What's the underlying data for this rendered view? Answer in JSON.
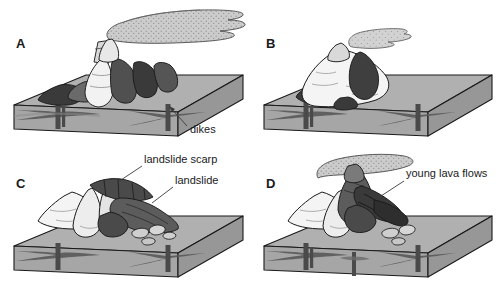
{
  "figure": {
    "background_color": "#ffffff",
    "panel_count": 4
  },
  "palette": {
    "block_top": "#b0b0b0",
    "block_front": "#a3a3a3",
    "block_side": "#9a9a9a",
    "outline": "#1a1a1a",
    "cone_light": "#f2f2f2",
    "cone_midlight": "#d6d6d6",
    "flow_mid": "#8a8a8a",
    "flow_dark": "#4a4a4a",
    "flow_darkest": "#2e2e2e",
    "plume_fill": "#c9c9c9",
    "plume_stipple": "#8f8f8f",
    "dike_dark": "#4f4f4f",
    "sill_gray": "#8c8c8c",
    "label_text": "#1a1a1a",
    "leader_line": "#3a3a3a"
  },
  "panels": [
    {
      "id": "A",
      "letter": "A",
      "caption_stage": "Active volcano erupting, fed by dikes",
      "features": [
        "eruption-plume",
        "summit-vent",
        "lava-flows",
        "dikes"
      ],
      "annotations": [
        {
          "id": "dikes",
          "label": "dikes",
          "target": "dike-structure",
          "text_x": 190,
          "text_y": 133,
          "arrow_from_x": 187,
          "arrow_from_y": 126,
          "arrow_to_x": 169,
          "arrow_to_y": 106
        }
      ]
    },
    {
      "id": "B",
      "letter": "B",
      "caption_stage": "Volcano edifice grown large, weak interior",
      "features": [
        "small-plume",
        "broad-cone",
        "dark-flow-patches",
        "dikes"
      ],
      "annotations": []
    },
    {
      "id": "C",
      "letter": "C",
      "caption_stage": "Flank collapse produces landslide and scarp",
      "features": [
        "landslide-scarp",
        "landslide-deposit",
        "hummocks",
        "dikes"
      ],
      "annotations": [
        {
          "id": "landslide-scarp",
          "label": "landslide scarp",
          "target": "scarp-rim",
          "text_x": 144,
          "text_y": 163,
          "arrow_from_x": 142,
          "arrow_from_y": 166,
          "arrow_to_x": 118,
          "arrow_to_y": 182
        },
        {
          "id": "landslide",
          "label": "landslide",
          "target": "landslide-deposit",
          "text_x": 175,
          "text_y": 184,
          "arrow_from_x": 173,
          "arrow_from_y": 187,
          "arrow_to_x": 152,
          "arrow_to_y": 203
        }
      ]
    },
    {
      "id": "D",
      "letter": "D",
      "caption_stage": "New eruptions fill the collapse scar with young lava",
      "features": [
        "eruption-plume",
        "new-cone",
        "young-lava-flows",
        "hummocks",
        "dikes"
      ],
      "annotations": [
        {
          "id": "young-lava-flows",
          "label": "young lava flows",
          "target": "young-flow-lobe",
          "text_x": 406,
          "text_y": 177,
          "arrow_from_x": 404,
          "arrow_from_y": 181,
          "arrow_to_x": 381,
          "arrow_to_y": 196
        }
      ]
    }
  ]
}
